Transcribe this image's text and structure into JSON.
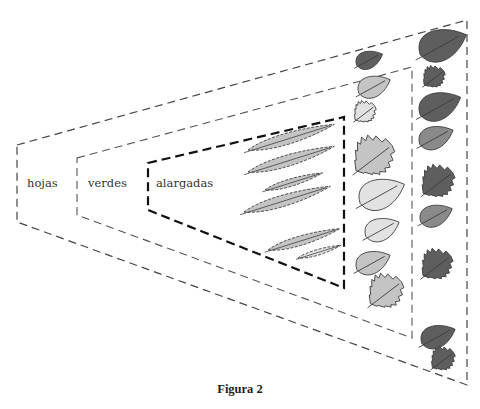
{
  "figure": {
    "caption": "Figura 2",
    "sets": [
      {
        "id": "hojas",
        "label": "hojas",
        "line_color": "#444444",
        "stroke_width": 1.2,
        "polygon": [
          [
            17,
            145
          ],
          [
            467,
            20
          ],
          [
            467,
            385
          ],
          [
            17,
            222
          ]
        ]
      },
      {
        "id": "verdes",
        "label": "verdes",
        "line_color": "#555555",
        "stroke_width": 1.1,
        "polygon": [
          [
            77,
            158
          ],
          [
            412,
            67
          ],
          [
            412,
            338
          ],
          [
            77,
            215
          ]
        ]
      },
      {
        "id": "alargadas",
        "label": "alargadas",
        "line_color": "#111111",
        "stroke_width": 2.2,
        "polygon": [
          [
            148,
            163
          ],
          [
            344,
            117
          ],
          [
            344,
            288
          ],
          [
            148,
            210
          ]
        ]
      }
    ],
    "leaves": {
      "colors": {
        "dark": "#5e5e5e",
        "medium": "#8a8a8a",
        "light": "#c4c4c4",
        "pale": "#e2e2e2",
        "outline": "#3a3a3a"
      },
      "alargadas": [
        {
          "x": 248,
          "y": 150,
          "len": 90,
          "shade": "light"
        },
        {
          "x": 248,
          "y": 172,
          "len": 90,
          "shade": "light"
        },
        {
          "x": 265,
          "y": 190,
          "len": 60,
          "shade": "light"
        },
        {
          "x": 244,
          "y": 212,
          "len": 90,
          "shade": "light"
        },
        {
          "x": 268,
          "y": 250,
          "len": 75,
          "shade": "light"
        },
        {
          "x": 298,
          "y": 258,
          "len": 45,
          "shade": "pale"
        }
      ],
      "verdes": [
        {
          "x": 375,
          "y": 88,
          "w": 34,
          "type": "smooth",
          "shade": "light"
        },
        {
          "x": 365,
          "y": 113,
          "w": 24,
          "type": "serrated",
          "shade": "pale"
        },
        {
          "x": 374,
          "y": 158,
          "w": 44,
          "type": "serrated",
          "shade": "light"
        },
        {
          "x": 383,
          "y": 196,
          "w": 48,
          "type": "smooth",
          "shade": "pale"
        },
        {
          "x": 383,
          "y": 231,
          "w": 36,
          "type": "smooth",
          "shade": "pale"
        },
        {
          "x": 374,
          "y": 264,
          "w": 36,
          "type": "smooth",
          "shade": "light"
        },
        {
          "x": 386,
          "y": 293,
          "w": 38,
          "type": "serrated",
          "shade": "light"
        }
      ],
      "hojas": [
        {
          "x": 370,
          "y": 61,
          "w": 28,
          "type": "smooth",
          "shade": "dark"
        },
        {
          "x": 444,
          "y": 47,
          "w": 50,
          "type": "smooth",
          "shade": "dark"
        },
        {
          "x": 434,
          "y": 78,
          "w": 24,
          "type": "serrated",
          "shade": "dark"
        },
        {
          "x": 441,
          "y": 108,
          "w": 44,
          "type": "smooth",
          "shade": "dark"
        },
        {
          "x": 437,
          "y": 139,
          "w": 36,
          "type": "smooth",
          "shade": "medium"
        },
        {
          "x": 438,
          "y": 183,
          "w": 36,
          "type": "serrated",
          "shade": "dark"
        },
        {
          "x": 437,
          "y": 217,
          "w": 34,
          "type": "smooth",
          "shade": "medium"
        },
        {
          "x": 437,
          "y": 266,
          "w": 34,
          "type": "serrated",
          "shade": "dark"
        },
        {
          "x": 439,
          "y": 338,
          "w": 36,
          "type": "smooth",
          "shade": "dark"
        },
        {
          "x": 443,
          "y": 360,
          "w": 26,
          "type": "serrated",
          "shade": "dark"
        }
      ]
    }
  }
}
